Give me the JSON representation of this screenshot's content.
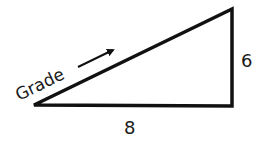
{
  "diagram": {
    "type": "right-triangle",
    "shape": {
      "vertices": {
        "left": [
          34,
          105
        ],
        "bottom_right": [
          232,
          106
        ],
        "top_right": [
          232,
          9
        ]
      },
      "stroke_color": "#111111",
      "stroke_width": 3.5,
      "fill": "#ffffff"
    },
    "labels": {
      "hypotenuse": "Grade",
      "vertical_side": "6",
      "horizontal_side": "8"
    },
    "arrow": {
      "direction": "up-right along hypotenuse",
      "color": "#111111"
    }
  }
}
